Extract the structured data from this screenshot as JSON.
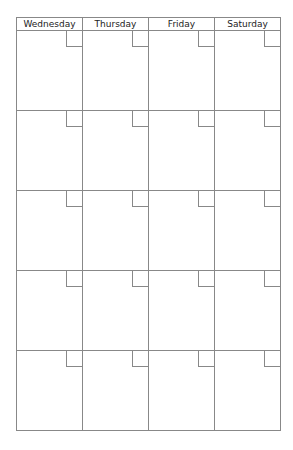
{
  "calendar": {
    "days": [
      "Wednesday",
      "Thursday",
      "Friday",
      "Saturday"
    ],
    "weeks": 5
  }
}
